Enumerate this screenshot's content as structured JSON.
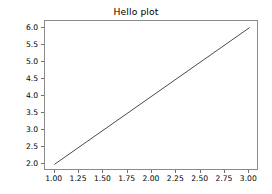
{
  "chart_data": {
    "type": "line",
    "title": "Hello plot",
    "xlabel": "",
    "ylabel": "",
    "x": [
      1,
      2,
      3
    ],
    "series": [
      {
        "name": "",
        "values": [
          2,
          4,
          6
        ],
        "color": "#4a4a4a",
        "linewidth": 1.0,
        "linestyle": "solid"
      }
    ],
    "xlim": [
      0.9,
      3.1
    ],
    "ylim": [
      1.8,
      6.2
    ],
    "xticks": [
      1.0,
      1.25,
      1.5,
      1.75,
      2.0,
      2.25,
      2.5,
      2.75,
      3.0
    ],
    "xticklabels": [
      "1.00",
      "1.25",
      "1.50",
      "1.75",
      "2.00",
      "2.25",
      "2.50",
      "2.75",
      "3.00"
    ],
    "yticks": [
      2.0,
      2.5,
      3.0,
      3.5,
      4.0,
      4.5,
      5.0,
      5.5,
      6.0
    ],
    "yticklabels": [
      "2.0",
      "2.5",
      "3.0",
      "3.5",
      "4.0",
      "4.5",
      "5.0",
      "5.5",
      "6.0"
    ],
    "grid": false,
    "legend": null,
    "legend_position": "none",
    "background_color": "#ffffff",
    "axes_edge_color": "#8a8a8a",
    "tick_color": "#6e6e6e",
    "text_color": "#000000"
  }
}
